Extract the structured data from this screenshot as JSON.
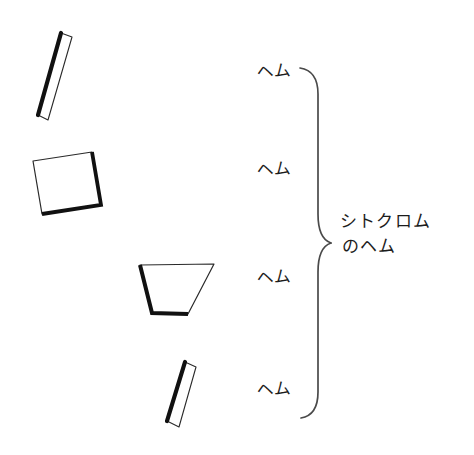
{
  "figure": {
    "background_color": "#ffffff",
    "ink_color": "#1a1a1a",
    "width": 474,
    "height": 455
  },
  "labels": {
    "heme_1": "ヘム",
    "heme_2": "ヘム",
    "heme_3": "ヘム",
    "heme_4": "ヘム",
    "group_line_1": "シトクロム",
    "group_line_2": "のヘム"
  },
  "brace": {
    "name": "curly-brace-right",
    "top_y": 68,
    "bottom_y": 418,
    "apex_x": 331,
    "apex_y": 243,
    "spine_x": 318,
    "stroke_color": "#4a4a4a",
    "stroke_width": 1.6
  },
  "plates": [
    {
      "id": "heme-plate-1",
      "description": "narrow edge-on parallelogram, steeply tilted, top-left",
      "points": "61,33 72,37 48,120 38,115",
      "thick_edge": "61,33 38,115",
      "fill": "#ffffff",
      "outline_color": "#2a2a2a",
      "thick_color": "#111111",
      "outline_width": 1.1,
      "thick_width": 4.0
    },
    {
      "id": "heme-plate-2",
      "description": "tilted square viewed near face-on, left middle-upper",
      "points": "33,161 92,152 101,205 42,214",
      "thick_edge": "92,152 101,205 42,214",
      "fill": "#ffffff",
      "outline_color": "#2a2a2a",
      "thick_color": "#111111",
      "outline_width": 1.1,
      "thick_width": 3.6
    },
    {
      "id": "heme-plate-3",
      "description": "sheared parallelogram viewed obliquely, center",
      "points": "140,265 214,264 188,314 152,313",
      "thick_edge": "140,265 152,313 188,314",
      "fill": "#ffffff",
      "outline_color": "#2a2a2a",
      "thick_color": "#111111",
      "outline_width": 1.1,
      "thick_width": 3.8
    },
    {
      "id": "heme-plate-4",
      "description": "narrow edge-on parallelogram, slanted right, lower center",
      "points": "185,362 195,366 179,427 168,421",
      "thick_edge": "185,362 168,421",
      "fill": "#ffffff",
      "outline_color": "#2a2a2a",
      "thick_color": "#111111",
      "outline_width": 1.1,
      "thick_width": 4.0
    }
  ],
  "label_positions": {
    "heme_1": {
      "left": 256,
      "top": 64
    },
    "heme_2": {
      "left": 256,
      "top": 162
    },
    "heme_3": {
      "left": 256,
      "top": 270
    },
    "heme_4": {
      "left": 256,
      "top": 382
    },
    "group": {
      "left": 340,
      "top": 209
    }
  }
}
